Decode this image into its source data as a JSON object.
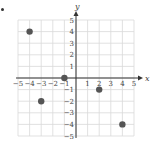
{
  "chart_data": {
    "type": "scatter",
    "title": "",
    "xlabel": "x",
    "ylabel": "y",
    "xlim": [
      -5,
      5
    ],
    "ylim": [
      -5,
      5
    ],
    "grid": true,
    "legend": null,
    "x_ticks": [
      -5,
      -4,
      -3,
      -2,
      -1,
      1,
      2,
      3,
      4,
      5
    ],
    "y_ticks": [
      -5,
      -4,
      -3,
      -2,
      -1,
      1,
      2,
      3,
      4,
      5
    ],
    "x_tick_labels": [
      "−5",
      "−4",
      "−3",
      "−2",
      "−1",
      "1",
      "2",
      "3",
      "4",
      "5"
    ],
    "y_tick_labels": [
      "−5",
      "−4",
      "−3",
      "−2",
      "−1",
      "1",
      "2",
      "3",
      "4",
      "5"
    ],
    "series": [
      {
        "name": "points",
        "points": [
          {
            "x": -4,
            "y": 4
          },
          {
            "x": -1,
            "y": 0
          },
          {
            "x": -3,
            "y": -2
          },
          {
            "x": 2,
            "y": -1
          },
          {
            "x": 4,
            "y": -4
          }
        ]
      }
    ]
  },
  "colors": {
    "grid": "#d9d9d9",
    "axis": "#333333",
    "point": "#555555",
    "text": "#444444"
  }
}
